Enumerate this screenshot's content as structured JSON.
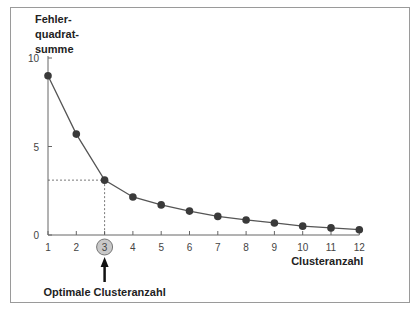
{
  "chart_data": {
    "type": "line",
    "title": "",
    "ylabel": "Fehler-\nquadrat-\nsumme",
    "xlabel": "Clusteranzahl",
    "x": [
      1,
      2,
      3,
      4,
      5,
      6,
      7,
      8,
      9,
      10,
      11,
      12
    ],
    "categories": [
      "1",
      "2",
      "3",
      "4",
      "5",
      "6",
      "7",
      "8",
      "9",
      "10",
      "11",
      "12"
    ],
    "series": [
      {
        "name": "Fehlerquadratsumme",
        "values": [
          9.0,
          5.7,
          3.1,
          2.15,
          1.7,
          1.35,
          1.05,
          0.85,
          0.68,
          0.5,
          0.4,
          0.3
        ]
      }
    ],
    "yticks": [
      0,
      5,
      10
    ],
    "ylim": [
      0,
      10
    ],
    "xlim": [
      1,
      12
    ],
    "grid": false,
    "legend": "none",
    "annotations": [
      {
        "text": "Optimale Clusteranzahl",
        "x": 3,
        "type": "arrow-up",
        "highlighted_tick": "3"
      },
      {
        "type": "dashed-guide",
        "x": 3,
        "y": 3.1
      }
    ]
  },
  "labels": {
    "y_axis": "Fehler-\nquadrat-\nsumme",
    "x_axis": "Clusteranzahl",
    "annotation": "Optimale Clusteranzahl"
  },
  "colors": {
    "line": "#555555",
    "marker": "#3a3a3a",
    "highlight_circle": "#c8c8c8",
    "frame": "#9a9a9a"
  }
}
